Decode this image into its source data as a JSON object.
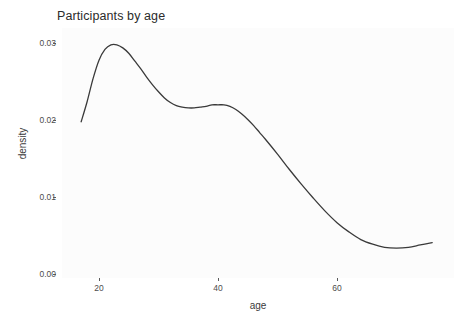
{
  "chart_data": {
    "type": "line",
    "title": "Participants by age",
    "xlabel": "age",
    "ylabel": "density",
    "xlim": [
      15,
      76
    ],
    "ylim": [
      0.0,
      0.032
    ],
    "xticks": [
      20,
      40,
      60
    ],
    "xtick_labels": [
      "20",
      "40",
      "60"
    ],
    "yticks": [
      0.0,
      0.01,
      0.02,
      0.03
    ],
    "ytick_labels": [
      "0.00",
      "0.01",
      "0.02",
      "0.03"
    ],
    "grid": false,
    "legend": null,
    "line_color": "#3a3a3a",
    "panel_color": "#fcfcfc",
    "series": [
      {
        "name": "density",
        "x": [
          17.0,
          18.0,
          19.0,
          20.0,
          21.0,
          22.0,
          23.0,
          24.0,
          25.0,
          26.0,
          27.0,
          28.0,
          29.0,
          30.0,
          31.0,
          32.0,
          33.0,
          34.0,
          35.0,
          36.0,
          37.0,
          38.0,
          39.0,
          40.0,
          41.0,
          42.0,
          43.0,
          44.0,
          45.0,
          46.0,
          47.0,
          48.0,
          50.0,
          52.0,
          54.0,
          56.0,
          58.0,
          60.0,
          62.0,
          64.0,
          66.0,
          68.0,
          70.0,
          72.0,
          74.0,
          76.0
        ],
        "y": [
          0.0199,
          0.0225,
          0.0255,
          0.0279,
          0.0293,
          0.0299,
          0.0299,
          0.0295,
          0.0288,
          0.0278,
          0.0268,
          0.0257,
          0.0247,
          0.0238,
          0.023,
          0.0224,
          0.022,
          0.0218,
          0.0217,
          0.0217,
          0.0218,
          0.0219,
          0.0221,
          0.0221,
          0.0221,
          0.0219,
          0.0215,
          0.0209,
          0.0202,
          0.0194,
          0.0185,
          0.0176,
          0.0157,
          0.0137,
          0.0118,
          0.01,
          0.0083,
          0.0068,
          0.0056,
          0.0046,
          0.004,
          0.0036,
          0.0035,
          0.0036,
          0.0039,
          0.0042
        ]
      }
    ]
  },
  "title": {
    "text": "Participants by age"
  },
  "axes": {
    "x": {
      "label": "age",
      "ticks": [
        "20",
        "40",
        "60"
      ]
    },
    "y": {
      "label": "density",
      "ticks": [
        "0.00",
        "0.01",
        "0.02",
        "0.03"
      ]
    }
  }
}
